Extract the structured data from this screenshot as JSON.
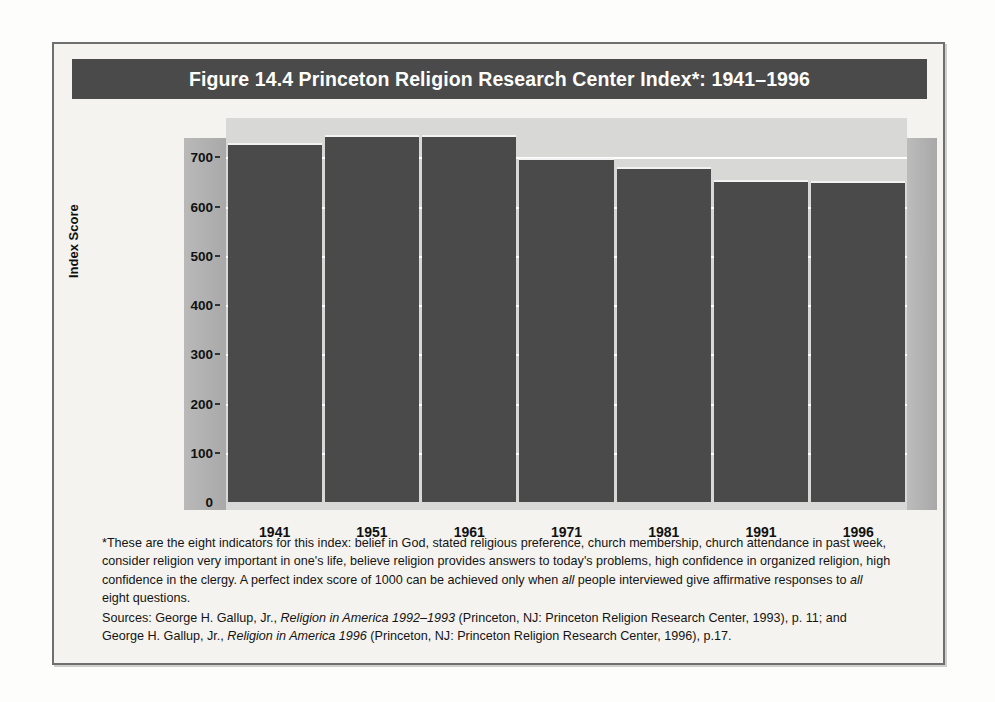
{
  "figure": {
    "title": "Figure 14.4  Princeton Religion Research Center Index*: 1941–1996",
    "title_bar_color": "#4a4a4a",
    "bar_color": "#4a4a4a",
    "plot_background_color": "#d8d8d6",
    "wall_color": "#b0b0b0",
    "gridline_color": "#ffffff"
  },
  "chart_data": {
    "type": "bar",
    "title": "Figure 14.4  Princeton Religion Research Center Index*: 1941–1996",
    "xlabel": "",
    "ylabel": "Index Score",
    "categories": [
      "1941",
      "1951",
      "1961",
      "1971",
      "1981",
      "1991",
      "1996"
    ],
    "values": [
      730,
      746,
      745,
      698,
      680,
      655,
      652
    ],
    "ylim": [
      0,
      780
    ],
    "yticks": [
      0,
      100,
      200,
      300,
      400,
      500,
      600,
      700
    ],
    "ytick_labels": [
      "0",
      "100",
      "200",
      "300",
      "400",
      "500",
      "600",
      "700"
    ],
    "grid": true,
    "legend": false,
    "series": [
      {
        "name": "Princeton Religion Research Center Index",
        "values": [
          730,
          746,
          745,
          698,
          680,
          655,
          652
        ]
      }
    ]
  },
  "footnote": {
    "note_part1": "*These are the eight indicators for this index: belief in God, stated religious preference, church membership, church attendance in past week, consider religion very important in one's life, believe religion provides answers to today's problems, high confidence in organized religion, high confidence in the clergy. A perfect index score of 1000 can be achieved only when ",
    "note_italic1": "all",
    "note_part2": " people interviewed give affirmative responses to ",
    "note_italic2": "all",
    "note_part3": " eight questions.",
    "sources_part1": "Sources: George H. Gallup, Jr., ",
    "sources_italic1": "Religion in America 1992–1993",
    "sources_part2": " (Princeton, NJ: Princeton Religion Research Center, 1993), p. 11; and George H. Gallup, Jr., ",
    "sources_italic2": "Religion in America 1996",
    "sources_part3": " (Princeton, NJ: Princeton Religion Research Center, 1996), p.17."
  }
}
